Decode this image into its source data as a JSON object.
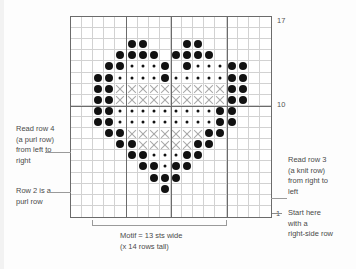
{
  "chart_data": {
    "type": "heatmap",
    "grid_columns": 18,
    "grid_rows": 18,
    "symbols": {
      "empty": "blank stitch",
      "dot-big": "large dot stitch",
      "dot-small": "small dot stitch",
      "x": "X cross stitch"
    },
    "legend_note": "Motif = 13 sts wide (x 14 rows tall)",
    "row_labels": [
      "17",
      "10",
      "1"
    ],
    "major_grid_columns": [
      5,
      9,
      14
    ],
    "major_grid_rows": [
      8
    ],
    "rows_top_to_bottom": [
      "..................",
      "..................",
      ".....BB...BB......",
      "....BBBB.BBBB.....",
      "...BBsssB.BsssBB..",
      "..BBssssBsssssBB..",
      "..BBxxxxxxxxxxBB..",
      "..BBxxxxxxxxxxBB..",
      "..BBsssssssssBB...",
      "..BBsssssssssBB...",
      "...BBxxxxxxxBB....",
      "....BBxxxxxBB.....",
      ".....BBsssBB......",
      "......BBsBB.......",
      ".......BBB........",
      "........B.........",
      "..................",
      ".................."
    ]
  },
  "row_numbers": {
    "top": "17",
    "middle": "10",
    "bottom": "1"
  },
  "annotations": {
    "left_top": "Read row 4\n(a purl row)\nfrom left to\nright",
    "left_bottom": "Row 2 is a\npurl row",
    "right_top": "Read row 3\n(a knit row)\nfrom right to\nleft",
    "right_bottom": "Start here\nwith a\nright-side row"
  },
  "caption": "Motif = 13 sts wide\n(x 14 rows tall)",
  "colors": {
    "grid_minor": "#d2d2d2",
    "grid_major": "#6b6b6b",
    "dot": "#111111",
    "x_mark": "#a8a8a8",
    "text": "#4a4a4a",
    "background": "#fdfdfd"
  }
}
